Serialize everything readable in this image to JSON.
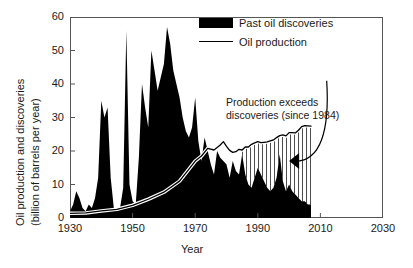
{
  "chart_data": {
    "type": "area",
    "title": "",
    "xlabel": "Year",
    "ylabel_line1": "Oil production and discoveries",
    "ylabel_line2": "(billion of barrels per year)",
    "xlim": [
      1930,
      2030
    ],
    "ylim": [
      0,
      60
    ],
    "xticks": [
      1930,
      1950,
      1970,
      1990,
      2010,
      2030
    ],
    "yticks": [
      0,
      10,
      20,
      30,
      40,
      50,
      60
    ],
    "grid": false,
    "legend_position": "top-right",
    "series": [
      {
        "name": "Past oil discoveries",
        "type": "area",
        "color": "#000000",
        "x": [
          1930,
          1931,
          1932,
          1933,
          1934,
          1935,
          1936,
          1937,
          1938,
          1939,
          1940,
          1941,
          1942,
          1943,
          1944,
          1945,
          1946,
          1947,
          1948,
          1949,
          1950,
          1951,
          1952,
          1953,
          1954,
          1955,
          1956,
          1957,
          1958,
          1959,
          1960,
          1961,
          1962,
          1963,
          1964,
          1965,
          1966,
          1967,
          1968,
          1969,
          1970,
          1971,
          1972,
          1973,
          1974,
          1975,
          1976,
          1977,
          1978,
          1979,
          1980,
          1981,
          1982,
          1983,
          1984,
          1985,
          1986,
          1987,
          1988,
          1989,
          1990,
          1991,
          1992,
          1993,
          1994,
          1995,
          1996,
          1997,
          1998,
          1999,
          2000,
          2001,
          2002,
          2003,
          2004,
          2005,
          2006,
          2007
        ],
        "values": [
          2,
          4,
          8,
          6,
          3,
          2,
          4,
          3,
          6,
          12,
          35,
          30,
          33,
          12,
          3,
          2,
          3,
          9,
          56,
          10,
          5,
          4,
          18,
          40,
          33,
          27,
          50,
          44,
          38,
          42,
          46,
          57,
          52,
          44,
          40,
          36,
          30,
          26,
          24,
          27,
          36,
          23,
          17,
          24,
          20,
          16,
          13,
          20,
          18,
          17,
          16,
          12,
          17,
          14,
          13,
          19,
          13,
          10,
          9,
          12,
          15,
          13,
          11,
          9,
          8,
          9,
          12,
          19,
          11,
          8,
          10,
          8,
          7,
          6,
          5,
          5,
          4,
          4
        ]
      },
      {
        "name": "Oil production",
        "type": "line",
        "color": "#000000",
        "x": [
          1930,
          1935,
          1940,
          1945,
          1950,
          1955,
          1960,
          1965,
          1970,
          1972,
          1974,
          1976,
          1978,
          1979,
          1980,
          1981,
          1982,
          1983,
          1984,
          1985,
          1986,
          1987,
          1988,
          1989,
          1990,
          1991,
          1992,
          1993,
          1994,
          1995,
          1996,
          1997,
          1998,
          1999,
          2000,
          2001,
          2002,
          2003,
          2004,
          2005,
          2006,
          2007
        ],
        "values": [
          1.4,
          1.5,
          2.1,
          2.6,
          3.8,
          5.6,
          7.7,
          11.0,
          17.0,
          18.5,
          20.8,
          20.3,
          21.8,
          22.8,
          21.4,
          20.2,
          19.6,
          19.8,
          20.5,
          20.3,
          21.2,
          21.2,
          22.0,
          22.4,
          22.8,
          22.5,
          22.6,
          22.7,
          23.0,
          23.3,
          24.0,
          24.6,
          24.8,
          24.5,
          25.5,
          25.5,
          25.4,
          26.2,
          27.3,
          27.6,
          27.5,
          27.4
        ]
      }
    ],
    "annotations": [
      {
        "name": "production-exceeds-discoveries",
        "line1": "Production exceeds",
        "line2": "discoveries (since 1984)",
        "hatch_start_year": 1984,
        "hatch_end_year": 2007
      }
    ],
    "legend": [
      {
        "label": "Past oil discoveries",
        "marker": "filled-swatch"
      },
      {
        "label": "Oil production",
        "marker": "line"
      }
    ]
  },
  "colors": {
    "series_fill": "#000000",
    "axis": "#555555",
    "text": "#1a1a1a",
    "background": "#ffffff"
  }
}
